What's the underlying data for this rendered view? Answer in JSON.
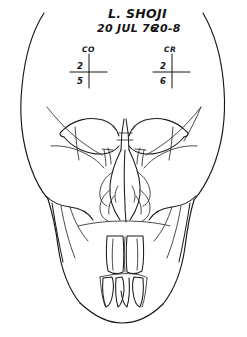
{
  "document": {
    "type": "hand-drawn radiographic facial tracing",
    "view": "frontal / posteroanterior skull"
  },
  "annotations": {
    "patient_name": "L. SHOJI",
    "date": "20 JUL 76",
    "record_number": "20-8"
  },
  "measurements": [
    {
      "id": "left",
      "code": "CO",
      "numerator": "2",
      "denominator": "5"
    },
    {
      "id": "right",
      "code": "CR",
      "numerator": "2",
      "denominator": "6"
    }
  ],
  "drawing": {
    "background_color": "#ffffff",
    "ink_color": "#1a1a1a",
    "regions": [
      "skull-outline",
      "left-orbit",
      "right-orbit",
      "nasal-septum",
      "nasal-turbinates",
      "left-zygomatic-arch",
      "right-zygomatic-arch",
      "maxillary-occlusal-line",
      "upper-incisors",
      "lower-incisors",
      "mandible-chin"
    ]
  }
}
